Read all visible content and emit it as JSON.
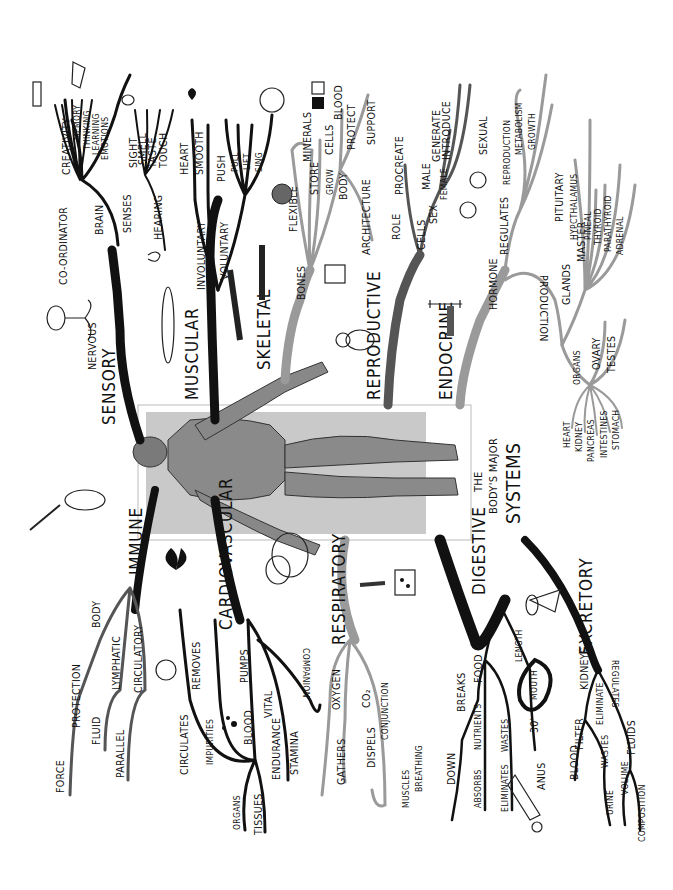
{
  "title": {
    "line1": "THE",
    "line2": "BODY'S MAJOR",
    "line3": "SYSTEMS"
  },
  "systems": {
    "sensory": {
      "label": "SENSORY",
      "nervous": "NERVOUS",
      "co_ordinator": "CO-ORDINATOR",
      "brain": "BRAIN",
      "brain_items": [
        "CREATIVITY",
        "MEMORY",
        "THINKING",
        "LEARNING",
        "EMOTIONS"
      ],
      "senses": "SENSES",
      "senses_items": [
        "SIGHT",
        "SMELL",
        "TASTE",
        "TOUCH"
      ],
      "hearing": "HEARING"
    },
    "muscular": {
      "label": "MUSCULAR",
      "involuntary": "INVOLUNTARY",
      "involuntary_items": [
        "HEART",
        "SMOOTH"
      ],
      "voluntary": "VOLUNTARY",
      "voluntary_items": [
        "PUSH",
        "PULL",
        "LIFT",
        "SING"
      ]
    },
    "skeletal": {
      "label": "SKELETAL",
      "bones": "BONES",
      "flexible": "FLEXIBLE",
      "store": "STORE",
      "minerals": "MINERALS",
      "grow": "GROW",
      "cells": "CELLS",
      "blood": "BLOOD",
      "body": "BODY",
      "protect": "PROTECT",
      "architecture": "ARCHITECTURE",
      "support": "SUPPORT"
    },
    "reproductive": {
      "label": "REPRODUCTIVE",
      "role": "ROLE",
      "procreate": "PROCREATE",
      "cells": "CELLS",
      "sex": "SEX",
      "male": "MALE",
      "female": "FEMALE",
      "generate": "GENERATE",
      "introduce": "INTRODUCE"
    },
    "endocrine": {
      "label": "ENDOCRINE",
      "hormone": "HORMONE",
      "regulates": "REGULATES",
      "regulates_items": [
        "SEXUAL",
        "REPRODUCTION",
        "METABOLISM",
        "GROWTH"
      ],
      "production": "PRODUCTION",
      "glands": "GLANDS",
      "master": "MASTER",
      "pituitary": "PITUITARY",
      "gland_items": [
        "HYPCTHALAMUS",
        "PINEAL",
        "THYROID",
        "PARATHYROID",
        "ADRENAL"
      ],
      "organs": "ORGANS",
      "organs_top": [
        "OVARY",
        "TESTES"
      ],
      "organs_bottom": [
        "HEART",
        "KIDNEY",
        "PANCREAS",
        "INTESTINES",
        "STOMACH"
      ]
    },
    "immune": {
      "label": "IMMUNE",
      "body": "BODY",
      "protection": "PROTECTION",
      "force": "FORCE",
      "lymphatic": "LYMPHATIC",
      "fluid": "FLUID",
      "circulatory": "CIRCULATORY",
      "parallel": "PARALLEL"
    },
    "cardiovascular": {
      "label": "CARDIOVASCULAR",
      "pumps": "PUMPS",
      "blood": "BLOOD",
      "removes": "REMOVES",
      "impurities": "IMPURITIES",
      "circulates": "CIRCULATES",
      "organs": "ORGANS",
      "tissues": "TISSUES",
      "vital": "VITAL",
      "endurance": "ENDURANCE",
      "stamina": "STAMINA",
      "companion": "COMPANION"
    },
    "respiratory": {
      "label": "RESPIRATORY",
      "oxygen": "OXYGEN",
      "gathers": "GATHERS",
      "co2": "CO₂",
      "dispels": "DISPELS",
      "conjunction": "CONJUNCTION",
      "muscles": "MUSCLES",
      "breathing": "BREATHING"
    },
    "digestive": {
      "label": "DIGESTIVE",
      "food": "FOOD",
      "breaks": "BREAKS",
      "down": "DOWN",
      "absorbs": "ABSORBS",
      "nutrients": "NUTRIENTS",
      "eliminates": "ELIMINATES",
      "wastes": "WASTES",
      "length": "LENGTH",
      "mouth": "MOUTH",
      "thirty_ft": "30'",
      "anus": "ANUS"
    },
    "excretory": {
      "label": "EXCRETORY",
      "kidneys": "KIDNEYS",
      "filter": "FILTER",
      "blood": "BLOOD",
      "eliminate": "ELIMINATE",
      "wastes": "WASTES",
      "urine": "URINE",
      "regulates": "REGULATES",
      "fluids": "FLUIDS",
      "volume": "VOLUME",
      "composition": "COMPOSITION"
    }
  },
  "colors": {
    "ink": "#111111",
    "grey_branch": "#9a9a9a",
    "figure_panel": "#c9c9c9",
    "figure_skin": "#8a8a8a"
  }
}
